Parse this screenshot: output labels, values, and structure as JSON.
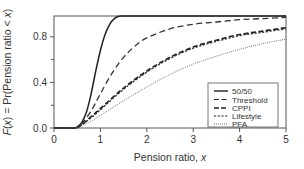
{
  "chart_data": {
    "type": "line",
    "title": "",
    "xlabel": "Pension ratio, x",
    "xlabel_parts": {
      "prefix": "Pension ratio, ",
      "var": "x"
    },
    "ylabel": "F(x) = Pr(Pension ratio < x)",
    "ylabel_parts": {
      "f": "F",
      "open": "(",
      "var": "x",
      "mid": ") = Pr(Pension ratio < ",
      "var2": "x",
      "close": ")"
    },
    "xlim": [
      0,
      5
    ],
    "ylim": [
      0,
      0.98
    ],
    "xticks": [
      0,
      1,
      2,
      3,
      4,
      5
    ],
    "xtick_labels": [
      "0",
      "1",
      "2",
      "3",
      "4",
      "5"
    ],
    "yticks_major": [
      0.0,
      0.4,
      0.8
    ],
    "ytick_labels": [
      "0.0",
      "0.4",
      "0.8"
    ],
    "yticks_minor": [
      0.2,
      0.6
    ],
    "grid": false,
    "legend_position": "lower right",
    "series": [
      {
        "name": "50/50",
        "style": "solid",
        "x": [
          0,
          0.4,
          0.5,
          0.6,
          0.7,
          0.8,
          0.9,
          1.0,
          1.1,
          1.2,
          1.3,
          1.4,
          1.5,
          1.7,
          2,
          3,
          4,
          5
        ],
        "values": [
          0,
          0,
          0.01,
          0.05,
          0.14,
          0.3,
          0.5,
          0.68,
          0.82,
          0.91,
          0.96,
          0.98,
          0.99,
          1.0,
          1.0,
          1.0,
          1.0,
          1.0
        ]
      },
      {
        "name": "Threshold",
        "style": "dashed",
        "x": [
          0,
          0.45,
          0.6,
          0.8,
          1.0,
          1.25,
          1.5,
          1.75,
          2.0,
          2.5,
          3.0,
          3.5,
          4.0,
          4.5,
          5.0
        ],
        "values": [
          0,
          0,
          0.04,
          0.15,
          0.3,
          0.48,
          0.62,
          0.72,
          0.79,
          0.87,
          0.91,
          0.93,
          0.95,
          0.96,
          0.97
        ]
      },
      {
        "name": "CPPI",
        "style": "long-dash",
        "x": [
          0,
          0.45,
          0.6,
          0.8,
          1.0,
          1.5,
          2.0,
          2.5,
          3.0,
          3.5,
          4.0,
          4.5,
          5.0
        ],
        "values": [
          0,
          0,
          0.03,
          0.1,
          0.17,
          0.35,
          0.5,
          0.62,
          0.71,
          0.77,
          0.82,
          0.85,
          0.88
        ]
      },
      {
        "name": "Lifestyle",
        "style": "short-dash",
        "x": [
          0,
          0.45,
          0.6,
          0.8,
          1.0,
          1.5,
          2.0,
          2.5,
          3.0,
          3.5,
          4.0,
          4.5,
          5.0
        ],
        "values": [
          0,
          0,
          0.03,
          0.09,
          0.16,
          0.34,
          0.49,
          0.61,
          0.7,
          0.76,
          0.81,
          0.84,
          0.87
        ]
      },
      {
        "name": "PFA",
        "style": "dotted",
        "x": [
          0,
          0.45,
          0.6,
          0.8,
          1.0,
          1.5,
          2.0,
          2.5,
          3.0,
          3.5,
          4.0,
          4.5,
          5.0
        ],
        "values": [
          0,
          0,
          0.02,
          0.06,
          0.11,
          0.24,
          0.36,
          0.47,
          0.56,
          0.63,
          0.69,
          0.74,
          0.78
        ]
      }
    ]
  },
  "legend": {
    "items": [
      {
        "label": "50/50"
      },
      {
        "label": "Threshold"
      },
      {
        "label": "CPPI"
      },
      {
        "label": "Lifestyle"
      },
      {
        "label": "PFA"
      }
    ]
  }
}
